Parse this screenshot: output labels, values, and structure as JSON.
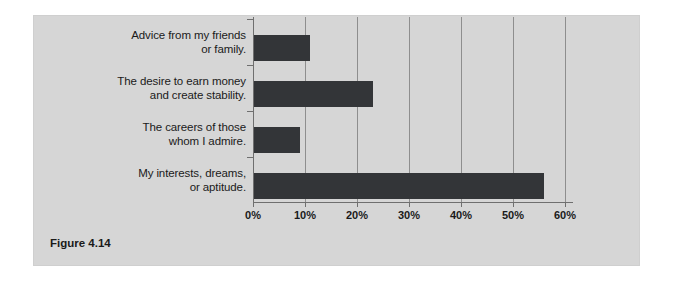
{
  "figure": {
    "caption": "Figure 4.14",
    "panel_color": "#d6d6d6",
    "bar_color": "#333538",
    "gridline_color": "#8e8e8e",
    "axis_color": "#6f6f6f"
  },
  "chart_data": {
    "type": "bar",
    "orientation": "horizontal",
    "title": "",
    "subtitle": "",
    "xlabel": "",
    "ylabel": "",
    "categories": [
      "Advice from my friends or family.",
      "The desire to earn money and create stability.",
      "The careers of those whom I admire.",
      "My interests, dreams, or aptitude."
    ],
    "category_lines": [
      [
        "Advice from my friends",
        "or family."
      ],
      [
        "The desire to earn money",
        "and create stability."
      ],
      [
        "The careers of those",
        "whom I admire."
      ],
      [
        "My interests, dreams,",
        "or aptitude."
      ]
    ],
    "values": [
      11,
      23,
      9,
      56
    ],
    "value_labels": [
      "11%",
      "23%",
      "9%",
      "56%"
    ],
    "xlim": [
      0,
      60
    ],
    "xticks": [
      0,
      10,
      20,
      30,
      40,
      50,
      60
    ],
    "xtick_labels": [
      "0%",
      "10%",
      "20%",
      "30%",
      "40%",
      "50%",
      "60%"
    ],
    "grid": true,
    "grid_axis": "x",
    "legend": false,
    "legend_position": "none"
  }
}
